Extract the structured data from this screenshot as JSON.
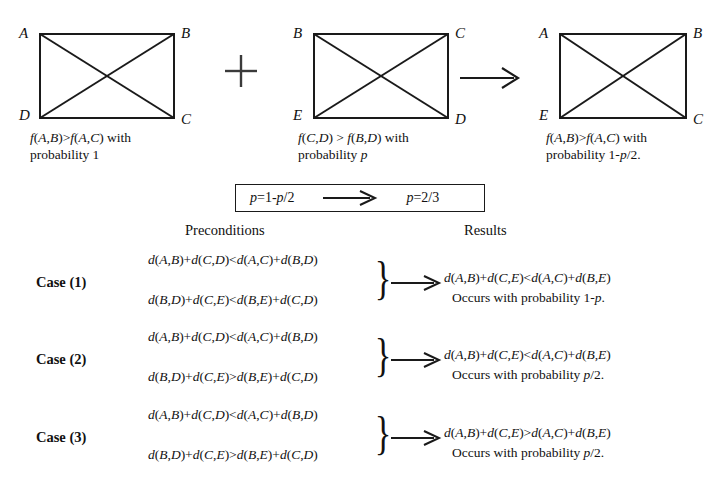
{
  "figure": {
    "graphs": [
      {
        "id": "graph-left",
        "labels": {
          "tl": "A",
          "tr": "B",
          "bl": "D",
          "br": "C"
        },
        "caption_line1_pre": "f",
        "caption_line1": "f(A,B)>f(A,C) with",
        "caption_line2": "probability 1"
      },
      {
        "id": "graph-middle",
        "labels": {
          "tl": "B",
          "tr": "C",
          "bl": "E",
          "br": "D"
        },
        "caption_line1": "f(C,D) > f(B,D) with",
        "caption_line2": "probability p"
      },
      {
        "id": "graph-right",
        "labels": {
          "tl": "A",
          "tr": "B",
          "bl": "E",
          "br": "C"
        },
        "caption_line1": "f(A,B)>f(A,C) with",
        "caption_line2": "probability 1-p/2."
      }
    ],
    "operators": {
      "plus": "+",
      "implies": "→"
    }
  },
  "equation_box": {
    "left_side": "p=1-p/2",
    "arrow": "⟶",
    "right_side": "p=2/3"
  },
  "headers": {
    "preconditions": "Preconditions",
    "results": "Results"
  },
  "cases": [
    {
      "label": "Case (1)",
      "precondition_1": "d(A,B)+d(C,D)<d(A,C)+d(B,D)",
      "precondition_2": "d(B,D)+d(C,E)<d(B,E)+d(C,D)",
      "brace": "}",
      "arrow": "⟶",
      "result_1": "d(A,B)+d(C,E)<d(A,C)+d(B,E)",
      "result_2": "Occurs with probability 1-p."
    },
    {
      "label": "Case (2)",
      "precondition_1": "d(A,B)+d(C,D)<d(A,C)+d(B,D)",
      "precondition_2": "d(B,D)+d(C,E)>d(B,E)+d(C,D)",
      "brace": "}",
      "arrow": "⟶",
      "result_1": "d(A,B)+d(C,E)<d(A,C)+d(B,E)",
      "result_2": "Occurs with probability p/2."
    },
    {
      "label": "Case (3)",
      "precondition_1": "d(A,B)+d(C,D)<d(A,C)+d(B,D)",
      "precondition_2": "d(B,D)+d(C,E)>d(B,E)+d(C,D)",
      "brace": "}",
      "arrow": "⟶",
      "result_1": "d(A,B)+d(C,E)>d(A,C)+d(B,E)",
      "result_2": "Occurs with probability p/2."
    }
  ],
  "colors": {
    "ink": "#1a1a1a",
    "background": "#ffffff"
  }
}
